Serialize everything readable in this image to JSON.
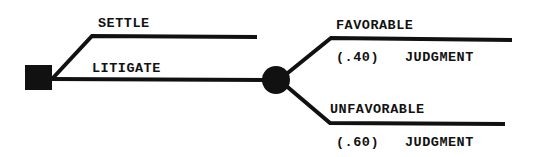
{
  "diagram": {
    "type": "decision-tree",
    "decision_node": {
      "shape": "square",
      "label": ""
    },
    "branches": [
      {
        "id": "settle",
        "label": "SETTLE"
      },
      {
        "id": "litigate",
        "label": "LITIGATE"
      }
    ],
    "chance_node": {
      "shape": "circle",
      "after": "litigate"
    },
    "outcomes": [
      {
        "id": "favorable",
        "label_top": "FAVORABLE",
        "probability": "(.40)",
        "label_bottom": "JUDGMENT"
      },
      {
        "id": "unfavorable",
        "label_top": "UNFAVORABLE",
        "probability": "(.60)",
        "label_bottom": "JUDGMENT"
      }
    ],
    "colors": {
      "ink": "#111111",
      "background": "#ffffff"
    }
  }
}
